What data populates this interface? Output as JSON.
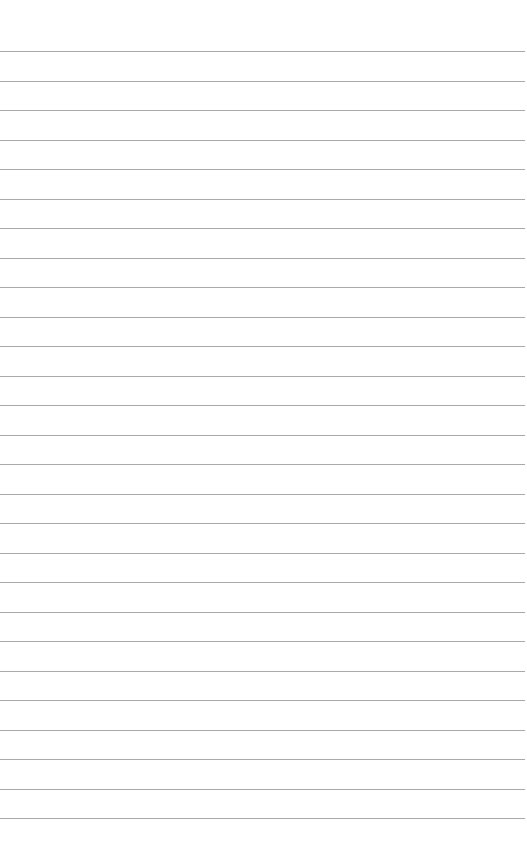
{
  "page": {
    "background": "#ffffff",
    "rule_color": "#9a9a9a",
    "rule_count": 27,
    "first_rule_y": 51,
    "rule_spacing": 29.5,
    "rule_width": 525
  }
}
